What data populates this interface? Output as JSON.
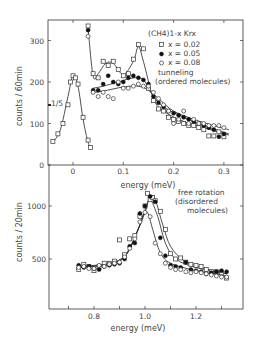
{
  "chart_data": [
    {
      "type": "scatter",
      "panel": "top",
      "title": "",
      "xlabel": "energy (meV)",
      "ylabel": "counts / 60min",
      "xlim": [
        -0.05,
        0.33
      ],
      "ylim": [
        0,
        350
      ],
      "xticks": [
        "0",
        "0.1",
        "0.2",
        "0.3"
      ],
      "yticks": [
        "0",
        "100",
        "200",
        "300"
      ],
      "legend": {
        "title": "(CH4)1-x Krx",
        "entries": [
          "x = 0.02",
          "x = 0.05",
          "x = 0.08"
        ],
        "position": "upper right"
      },
      "annotations": [
        "tunneling",
        "(ordered molecules)",
        "1/5"
      ],
      "series": [
        {
          "name": "x = 0.02",
          "marker": "open-square",
          "x": [
            -0.04,
            -0.03,
            -0.02,
            -0.01,
            -0.005,
            0.0,
            0.005,
            0.01,
            0.02,
            0.03,
            0.035,
            0.03,
            0.04,
            0.05,
            0.06,
            0.07,
            0.08,
            0.09,
            0.1,
            0.11,
            0.12,
            0.13,
            0.14,
            0.15,
            0.16,
            0.17,
            0.18,
            0.19,
            0.2,
            0.21,
            0.22,
            0.23,
            0.24,
            0.25,
            0.26,
            0.27,
            0.28,
            0.29,
            0.3
          ],
          "y": [
            57,
            75,
            100,
            145,
            200,
            215,
            210,
            195,
            115,
            60,
            42,
            335,
            220,
            210,
            250,
            240,
            250,
            230,
            215,
            220,
            255,
            290,
            280,
            185,
            155,
            135,
            130,
            115,
            110,
            105,
            100,
            95,
            95,
            90,
            85,
            70,
            70,
            80,
            68
          ]
        },
        {
          "name": "x = 0.05",
          "marker": "filled-circle",
          "x": [
            0.03,
            0.04,
            0.05,
            0.06,
            0.07,
            0.08,
            0.09,
            0.1,
            0.11,
            0.12,
            0.13,
            0.14,
            0.15,
            0.16,
            0.17,
            0.18,
            0.19,
            0.2,
            0.21,
            0.22,
            0.23,
            0.24,
            0.25,
            0.26,
            0.27,
            0.28,
            0.29,
            0.3
          ],
          "y": [
            325,
            180,
            180,
            195,
            215,
            200,
            195,
            200,
            210,
            215,
            210,
            205,
            195,
            165,
            150,
            140,
            130,
            125,
            120,
            115,
            110,
            105,
            100,
            95,
            90,
            85,
            68,
            75
          ]
        },
        {
          "name": "x = 0.08",
          "marker": "open-circle",
          "x": [
            0.03,
            0.04,
            0.05,
            0.06,
            0.07,
            0.08,
            0.09,
            0.1,
            0.11,
            0.12,
            0.13,
            0.14,
            0.15,
            0.16,
            0.17,
            0.18,
            0.19,
            0.2,
            0.21,
            0.22,
            0.23,
            0.24,
            0.25,
            0.26,
            0.27,
            0.28,
            0.29,
            0.3
          ],
          "y": [
            310,
            175,
            165,
            175,
            165,
            160,
            200,
            185,
            185,
            190,
            195,
            190,
            190,
            175,
            160,
            145,
            130,
            100,
            110,
            130,
            100,
            110,
            100,
            100,
            95,
            95,
            95,
            90
          ]
        }
      ],
      "grid": false
    },
    {
      "type": "scatter",
      "panel": "bottom",
      "title": "",
      "xlabel": "energy (meV)",
      "ylabel": "counts / 20min",
      "xlim": [
        0.63,
        1.35
      ],
      "ylim": [
        50,
        1200
      ],
      "xticks": [
        "0.8",
        "1.0",
        "1.2"
      ],
      "yticks": [
        "500",
        "1000"
      ],
      "annotations": [
        "free rotation",
        "(disordered",
        "molecules)"
      ],
      "series": [
        {
          "name": "x = 0.02",
          "marker": "open-square",
          "x": [
            0.74,
            0.76,
            0.78,
            0.8,
            0.82,
            0.84,
            0.86,
            0.88,
            0.9,
            0.92,
            0.94,
            0.96,
            0.98,
            1.0,
            1.01,
            1.02,
            1.03,
            1.04,
            1.06,
            1.08,
            1.1,
            1.12,
            1.14,
            1.16,
            1.18,
            1.2,
            1.22,
            1.24,
            1.26,
            1.28,
            1.3,
            1.32
          ],
          "y": [
            400,
            450,
            430,
            390,
            430,
            460,
            460,
            480,
            680,
            540,
            690,
            720,
            900,
            1000,
            1120,
            1060,
            1080,
            1050,
            950,
            780,
            550,
            500,
            510,
            470,
            450,
            440,
            430,
            400,
            380,
            380,
            370,
            320
          ]
        },
        {
          "name": "x = 0.05",
          "marker": "filled-circle",
          "x": [
            0.74,
            0.76,
            0.78,
            0.8,
            0.82,
            0.84,
            0.86,
            0.88,
            0.9,
            0.92,
            0.94,
            0.96,
            0.98,
            1.0,
            1.02,
            1.04,
            1.06,
            1.08,
            1.1,
            1.12,
            1.14,
            1.16,
            1.18,
            1.2,
            1.22,
            1.24,
            1.26,
            1.28,
            1.3,
            1.32
          ],
          "y": [
            440,
            420,
            430,
            410,
            400,
            430,
            440,
            450,
            460,
            500,
            620,
            650,
            930,
            1000,
            1090,
            1040,
            700,
            530,
            440,
            430,
            420,
            470,
            400,
            390,
            380,
            360,
            370,
            380,
            390,
            380
          ]
        },
        {
          "name": "x = 0.08",
          "marker": "open-circle",
          "x": [
            0.74,
            0.76,
            0.78,
            0.8,
            0.82,
            0.84,
            0.86,
            0.88,
            0.9,
            0.92,
            0.94,
            0.96,
            0.98,
            1.0,
            1.02,
            1.04,
            1.06,
            1.08,
            1.1,
            1.12,
            1.14,
            1.16,
            1.18,
            1.2,
            1.22,
            1.24,
            1.26,
            1.28,
            1.3,
            1.32
          ],
          "y": [
            420,
            430,
            410,
            410,
            440,
            430,
            450,
            460,
            470,
            520,
            600,
            690,
            850,
            940,
            900,
            650,
            550,
            460,
            420,
            400,
            400,
            380,
            370,
            380,
            370,
            360,
            350,
            340,
            330,
            330
          ]
        }
      ],
      "grid": false
    }
  ]
}
